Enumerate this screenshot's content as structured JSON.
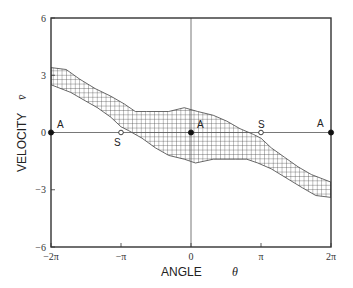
{
  "chart_data": {
    "type": "area",
    "title": "",
    "xlabel": "ANGLE",
    "xlabel_symbol": "θ",
    "ylabel": "VELOCITY",
    "ylabel_symbol": "v̄",
    "xlim": [
      -6.2832,
      6.2832
    ],
    "ylim": [
      -6,
      6
    ],
    "x_ticks": [
      {
        "value": -6.2832,
        "label": "−2π"
      },
      {
        "value": -3.1416,
        "label": "−π"
      },
      {
        "value": 0,
        "label": "0"
      },
      {
        "value": 3.1416,
        "label": "π"
      },
      {
        "value": 6.2832,
        "label": "2π"
      }
    ],
    "y_ticks": [
      {
        "value": 6,
        "label": "6"
      },
      {
        "value": 3,
        "label": "3"
      },
      {
        "value": 0,
        "label": "0"
      },
      {
        "value": -3,
        "label": "−3"
      },
      {
        "value": -6,
        "label": "−6"
      }
    ],
    "grid": false,
    "reference_lines": [
      {
        "orientation": "horizontal",
        "value": 0
      },
      {
        "orientation": "vertical",
        "value": 0
      }
    ],
    "series": [
      {
        "name": "basin of attraction (hatched region)",
        "fill": "crosshatch",
        "upper": [
          [
            -6.28,
            3.4
          ],
          [
            -5.6,
            3.3
          ],
          [
            -5.0,
            2.8
          ],
          [
            -4.3,
            2.3
          ],
          [
            -3.6,
            1.9
          ],
          [
            -3.0,
            1.5
          ],
          [
            -2.5,
            1.1
          ],
          [
            -2.0,
            1.1
          ],
          [
            -1.0,
            1.1
          ],
          [
            -0.3,
            1.3
          ],
          [
            0.3,
            1.1
          ],
          [
            1.0,
            0.9
          ],
          [
            1.6,
            0.6
          ],
          [
            2.2,
            0.2
          ],
          [
            2.8,
            -0.1
          ],
          [
            3.14,
            -0.3
          ],
          [
            3.6,
            -0.8
          ],
          [
            4.2,
            -1.3
          ],
          [
            4.8,
            -1.8
          ],
          [
            5.4,
            -2.2
          ],
          [
            6.28,
            -2.6
          ]
        ],
        "lower": [
          [
            6.28,
            -3.4
          ],
          [
            5.6,
            -3.3
          ],
          [
            5.0,
            -2.9
          ],
          [
            4.3,
            -2.4
          ],
          [
            3.6,
            -1.9
          ],
          [
            3.0,
            -1.6
          ],
          [
            2.5,
            -1.4
          ],
          [
            2.0,
            -1.4
          ],
          [
            1.0,
            -1.4
          ],
          [
            0.2,
            -1.6
          ],
          [
            -0.3,
            -1.4
          ],
          [
            -1.0,
            -1.2
          ],
          [
            -1.6,
            -0.8
          ],
          [
            -2.2,
            -0.3
          ],
          [
            -2.8,
            0.1
          ],
          [
            -3.14,
            0.3
          ],
          [
            -3.6,
            0.8
          ],
          [
            -4.2,
            1.3
          ],
          [
            -4.8,
            1.7
          ],
          [
            -5.4,
            2.1
          ],
          [
            -6.28,
            2.5
          ]
        ]
      }
    ],
    "points": [
      {
        "label": "A",
        "x": -6.2832,
        "y": 0,
        "marker": "filled"
      },
      {
        "label": "S",
        "x": -3.1416,
        "y": 0,
        "marker": "open"
      },
      {
        "label": "A",
        "x": 0,
        "y": 0,
        "marker": "filled"
      },
      {
        "label": "S",
        "x": 3.1416,
        "y": 0,
        "marker": "open"
      },
      {
        "label": "A",
        "x": 6.2832,
        "y": 0,
        "marker": "filled"
      }
    ]
  },
  "colors": {
    "frame": "#333333",
    "hatch": "#444444",
    "band_fill": "#ffffff"
  }
}
